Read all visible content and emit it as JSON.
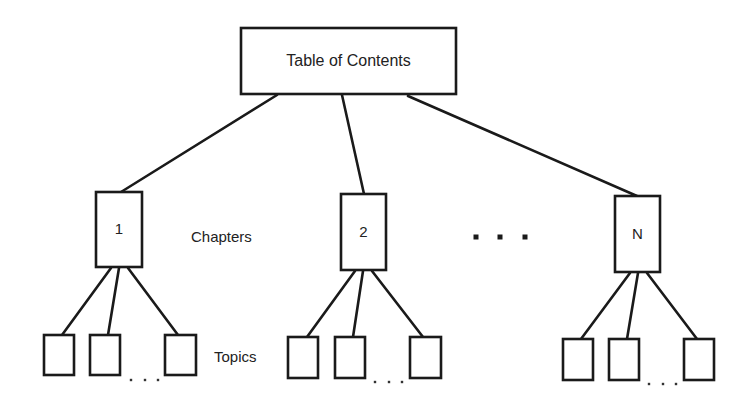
{
  "diagram": {
    "colors": {
      "stroke": "#1a1a1a",
      "text": "#222222",
      "background": "#ffffff"
    },
    "root": {
      "label": "Table of Contents",
      "x": 241,
      "y": 28,
      "w": 215,
      "h": 66
    },
    "level_labels": {
      "chapters": {
        "label": "Chapters",
        "x": 191,
        "y": 238
      },
      "topics": {
        "label": "Topics",
        "x": 214,
        "y": 358
      }
    },
    "chapters": [
      {
        "label": "1",
        "x": 96,
        "y": 192,
        "w": 46,
        "h": 75,
        "edge_from_root": [
          277,
          95,
          121,
          192
        ],
        "topics": [
          {
            "x": 44,
            "y": 335,
            "w": 30,
            "h": 40
          },
          {
            "x": 90,
            "y": 335,
            "w": 30,
            "h": 40
          },
          {
            "x": 165,
            "y": 335,
            "w": 31,
            "h": 40
          }
        ],
        "topic_edges": [
          [
            111,
            268,
            62,
            335
          ],
          [
            119,
            268,
            108,
            335
          ],
          [
            128,
            268,
            178,
            335
          ]
        ],
        "ellipsis_dots": [
          [
            131,
            380
          ],
          [
            145,
            380
          ],
          [
            158,
            380
          ]
        ]
      },
      {
        "label": "2",
        "x": 341,
        "y": 194,
        "w": 45,
        "h": 76,
        "edge_from_root": [
          342,
          95,
          364,
          194
        ],
        "topics": [
          {
            "x": 288,
            "y": 337,
            "w": 30,
            "h": 41
          },
          {
            "x": 335,
            "y": 337,
            "w": 30,
            "h": 41
          },
          {
            "x": 410,
            "y": 337,
            "w": 31,
            "h": 41
          }
        ],
        "topic_edges": [
          [
            355,
            271,
            307,
            337
          ],
          [
            363,
            271,
            353,
            337
          ],
          [
            372,
            271,
            423,
            337
          ]
        ],
        "ellipsis_dots": [
          [
            375,
            382
          ],
          [
            389,
            382
          ],
          [
            402,
            382
          ]
        ]
      },
      {
        "label": "N",
        "x": 615,
        "y": 196,
        "w": 45,
        "h": 76,
        "edge_from_root": [
          408,
          96,
          637,
          196
        ],
        "topics": [
          {
            "x": 563,
            "y": 339,
            "w": 30,
            "h": 41
          },
          {
            "x": 609,
            "y": 339,
            "w": 30,
            "h": 41
          },
          {
            "x": 684,
            "y": 339,
            "w": 30,
            "h": 41
          }
        ],
        "topic_edges": [
          [
            630,
            273,
            581,
            339
          ],
          [
            638,
            273,
            627,
            339
          ],
          [
            647,
            273,
            697,
            339
          ]
        ],
        "ellipsis_dots": [
          [
            649,
            384
          ],
          [
            663,
            384
          ],
          [
            676,
            384
          ]
        ]
      }
    ],
    "chapter_gap_ellipsis": {
      "dots": [
        [
          476,
          237
        ],
        [
          500,
          237
        ],
        [
          525,
          237
        ]
      ],
      "size": 5
    }
  }
}
